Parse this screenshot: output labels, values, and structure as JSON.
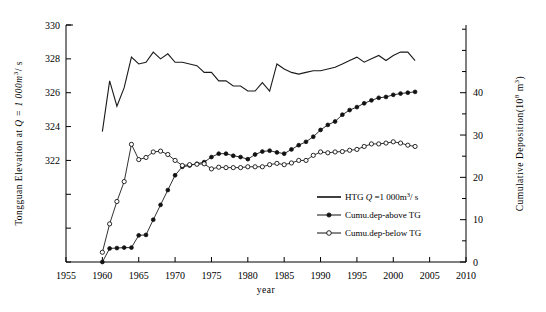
{
  "chart_data": {
    "type": "line",
    "title": "",
    "xlabel": "year",
    "ylabel_left": "Tongguan Elevation at  Q = 1 000m3/s",
    "ylabel_right": "Cumulative Deposition(108 m3)",
    "xlim": [
      1955,
      2010
    ],
    "xticks": [
      1955,
      1960,
      1965,
      1970,
      1975,
      1980,
      1985,
      1990,
      1995,
      2000,
      2005,
      2010
    ],
    "ylim_left": [
      316,
      330
    ],
    "yticks_left": [
      322,
      324,
      326,
      328,
      330
    ],
    "ylim_right": [
      0,
      56
    ],
    "yticks_right": [
      0,
      10,
      20,
      30,
      40
    ],
    "grid": false,
    "legend_position": "center-right",
    "series": [
      {
        "name": "HTG Q =1 000m3/s",
        "axis": "left",
        "marker": "none",
        "x": [
          1960,
          1961,
          1962,
          1963,
          1964,
          1965,
          1966,
          1967,
          1968,
          1969,
          1970,
          1971,
          1972,
          1973,
          1974,
          1975,
          1976,
          1977,
          1978,
          1979,
          1980,
          1981,
          1982,
          1983,
          1984,
          1985,
          1986,
          1987,
          1988,
          1989,
          1990,
          1991,
          1992,
          1993,
          1994,
          1995,
          1996,
          1997,
          1998,
          1999,
          2000,
          2001,
          2002,
          2003
        ],
        "y": [
          323.7,
          326.7,
          325.2,
          326.3,
          328.1,
          327.7,
          327.8,
          328.4,
          328.0,
          328.3,
          327.8,
          327.8,
          327.7,
          327.6,
          327.2,
          327.2,
          326.7,
          326.7,
          326.4,
          326.4,
          326.1,
          326.1,
          326.6,
          326.1,
          327.7,
          327.4,
          327.2,
          327.1,
          327.2,
          327.3,
          327.3,
          327.4,
          327.5,
          327.7,
          327.9,
          328.1,
          327.8,
          328.0,
          328.2,
          327.9,
          328.2,
          328.4,
          328.4,
          327.9
        ]
      },
      {
        "name": "Cumu.dep-above TG",
        "axis": "right",
        "marker": "filled-circle",
        "x": [
          1960,
          1961,
          1962,
          1963,
          1964,
          1965,
          1966,
          1967,
          1968,
          1969,
          1970,
          1971,
          1972,
          1973,
          1974,
          1975,
          1976,
          1977,
          1978,
          1979,
          1980,
          1981,
          1982,
          1983,
          1984,
          1985,
          1986,
          1987,
          1988,
          1989,
          1990,
          1991,
          1992,
          1993,
          1994,
          1995,
          1996,
          1997,
          1998,
          1999,
          2000,
          2001,
          2002,
          2003
        ],
        "y": [
          0.0,
          3.2,
          3.3,
          3.4,
          3.4,
          6.3,
          6.4,
          10.0,
          13.5,
          17.0,
          20.5,
          22.5,
          22.8,
          23.2,
          23.6,
          24.8,
          25.6,
          25.6,
          25.1,
          24.8,
          24.3,
          25.4,
          26.1,
          26.3,
          25.9,
          25.6,
          26.6,
          27.6,
          28.4,
          29.6,
          31.2,
          32.4,
          33.2,
          34.8,
          35.9,
          36.6,
          37.5,
          38.2,
          38.8,
          39.0,
          39.5,
          39.8,
          40.0,
          40.2
        ]
      },
      {
        "name": "Cumu.dep-below TG",
        "axis": "right",
        "marker": "open-circle",
        "x": [
          1960,
          1961,
          1962,
          1963,
          1964,
          1965,
          1966,
          1967,
          1968,
          1969,
          1970,
          1971,
          1972,
          1973,
          1974,
          1975,
          1976,
          1977,
          1978,
          1979,
          1980,
          1981,
          1982,
          1983,
          1984,
          1985,
          1986,
          1987,
          1988,
          1989,
          1990,
          1991,
          1992,
          1993,
          1994,
          1995,
          1996,
          1997,
          1998,
          1999,
          2000,
          2001,
          2002,
          2003
        ],
        "y": [
          2.3,
          9.0,
          14.3,
          19.0,
          27.8,
          24.2,
          24.7,
          26.0,
          26.2,
          25.4,
          24.0,
          22.8,
          23.0,
          23.1,
          23.2,
          22.0,
          22.4,
          22.3,
          22.3,
          22.3,
          22.5,
          22.5,
          22.5,
          23.0,
          23.3,
          23.0,
          23.4,
          24.0,
          24.0,
          25.2,
          26.0,
          25.8,
          26.0,
          26.1,
          26.4,
          26.6,
          27.3,
          27.9,
          27.9,
          28.1,
          28.4,
          28.1,
          27.6,
          27.3
        ]
      }
    ]
  },
  "legend": {
    "items": [
      {
        "label": "HTG  Q =1  000m",
        "sup": "3",
        "tail": "/ s",
        "marker": "line"
      },
      {
        "label": "Cumu.dep-above  TG",
        "marker": "filled-circle"
      },
      {
        "label": "Cumu.dep-below  TG",
        "marker": "open-circle"
      }
    ]
  },
  "axes": {
    "left_title_parts": {
      "pre": "Tongguan  Elevation  at  ",
      "q": "Q = 1  000m",
      "sup": "3",
      "post": "/ s"
    },
    "right_title_parts": {
      "pre": "Cumulative  Deposition(10",
      "sup": "8",
      "post": " m",
      "sup2": "3",
      "close": ")"
    },
    "xlabel": "year"
  }
}
